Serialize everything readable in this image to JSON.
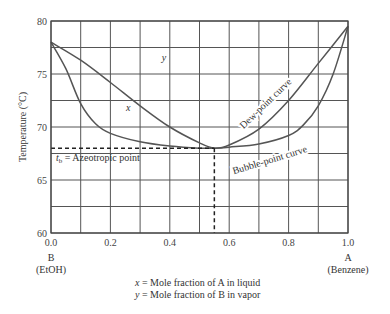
{
  "chart_data": {
    "type": "line",
    "title": "",
    "xlabel": "",
    "ylabel": "Temperature (°C)",
    "xlim": [
      0.0,
      1.0
    ],
    "ylim": [
      60,
      80
    ],
    "x_ticks": [
      "0.0",
      "0.2",
      "0.4",
      "0.6",
      "0.8",
      "1.0"
    ],
    "x_tick_values": [
      0.0,
      0.2,
      0.4,
      0.6,
      0.8,
      1.0
    ],
    "y_ticks": [
      "60",
      "65",
      "70",
      "75",
      "80"
    ],
    "y_tick_values": [
      60,
      65,
      70,
      75,
      80
    ],
    "x_grid_step": 0.1,
    "y_grid_step": 2.5,
    "grid": true,
    "x_end_labels": {
      "left": {
        "line1": "B",
        "line2": "(EtOH)"
      },
      "right": {
        "line1": "A",
        "line2": "(Benzene)"
      }
    },
    "footnotes": [
      {
        "var": "x",
        "text": " = Mole fraction of A in liquid"
      },
      {
        "var": "y",
        "text": " = Mole fraction of B in vapor"
      }
    ],
    "series": [
      {
        "name": "Dew-point curve",
        "curve_label": "y",
        "x": [
          0.0,
          0.1,
          0.2,
          0.3,
          0.4,
          0.5,
          0.55,
          0.6,
          0.7,
          0.8,
          0.9,
          1.0
        ],
        "y": [
          78.0,
          76.3,
          74.2,
          72.0,
          70.0,
          68.5,
          68.0,
          68.3,
          69.8,
          72.5,
          76.0,
          79.5
        ]
      },
      {
        "name": "Bubble-point curve",
        "curve_label": "x",
        "x": [
          0.0,
          0.05,
          0.1,
          0.15,
          0.2,
          0.3,
          0.4,
          0.5,
          0.55,
          0.6,
          0.7,
          0.8,
          0.85,
          0.9,
          0.95,
          1.0
        ],
        "y": [
          78.0,
          75.5,
          72.2,
          70.3,
          69.4,
          68.6,
          68.2,
          68.0,
          68.0,
          68.1,
          68.4,
          69.2,
          70.2,
          72.0,
          75.0,
          79.5
        ]
      }
    ],
    "azeotrope": {
      "x": 0.55,
      "t": 68.0,
      "label_sub": "b",
      "label_var": "t",
      "label_text": " = Azeotropic point"
    },
    "annotations": [
      {
        "text": "Dew-point curve",
        "x": 0.73,
        "t": 72.0,
        "rotation_deg": -44
      },
      {
        "text": "Bubble-point curve",
        "x": 0.74,
        "t": 66.6,
        "rotation_deg": -17
      },
      {
        "text": "y",
        "x": 0.38,
        "t": 76.2
      },
      {
        "text": "x",
        "x": 0.26,
        "t": 71.5
      }
    ]
  }
}
